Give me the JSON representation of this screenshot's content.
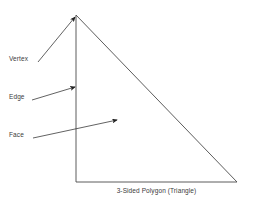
{
  "canvas": {
    "width": 253,
    "height": 203,
    "background_color": "#ffffff"
  },
  "figure": {
    "caption": "3-Sided Polygon (Triangle)",
    "shape_name": "triangle",
    "stroke_color": "#4a4a4a",
    "text_color": "#3b3b3b",
    "vertices": [
      {
        "name": "apex",
        "x": 76,
        "y": 15
      },
      {
        "name": "bottom-left",
        "x": 76,
        "y": 182
      },
      {
        "name": "bottom-right",
        "x": 237,
        "y": 182
      }
    ]
  },
  "annotations": [
    {
      "label": "Vertex",
      "target": "apex-point",
      "label_x": 9,
      "label_y": 55,
      "arrow_from": {
        "x": 38,
        "y": 62
      },
      "arrow_to": {
        "x": 75,
        "y": 17
      }
    },
    {
      "label": "Edge",
      "target": "left-edge",
      "label_x": 9,
      "label_y": 93,
      "arrow_from": {
        "x": 32,
        "y": 100
      },
      "arrow_to": {
        "x": 75,
        "y": 87
      }
    },
    {
      "label": "Face",
      "target": "interior-face",
      "label_x": 9,
      "label_y": 131,
      "arrow_from": {
        "x": 33,
        "y": 138
      },
      "arrow_to": {
        "x": 118,
        "y": 120
      }
    }
  ]
}
